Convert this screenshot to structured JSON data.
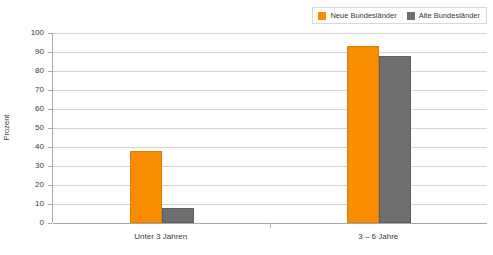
{
  "chart_data": {
    "type": "bar",
    "title": "",
    "subtitle": "",
    "xlabel": "",
    "ylabel": "Prozent",
    "ylim": [
      0,
      100
    ],
    "ytick_step": 10,
    "yticks": [
      "100",
      "90",
      "80",
      "70",
      "60",
      "50",
      "40",
      "30",
      "20",
      "10",
      "0"
    ],
    "grid": true,
    "legend_position": "top-right",
    "categories": [
      "Unter 3 Jahren",
      "3 – 6 Jahre"
    ],
    "series": [
      {
        "name": "Neue Bundesländer",
        "color": "#fa8c00",
        "values": [
          38,
          93
        ]
      },
      {
        "name": "Alte Bundesländer",
        "color": "#6e6e6e",
        "values": [
          8,
          88
        ]
      }
    ]
  },
  "legend": {
    "entries": [
      {
        "label": "Neue Bundesländer",
        "swatch": "orange-swatch-icon"
      },
      {
        "label": "Alte Bundesländer",
        "swatch": "grey-swatch-icon"
      }
    ]
  },
  "colors": {
    "series_1": "#fa8c00",
    "series_2": "#6e6e6e",
    "gridline": "#d4d4d4",
    "axis": "#a8a8a8",
    "text": "#3a3a3a",
    "legend_border": "#d8d8d8",
    "background": "#ffffff"
  }
}
